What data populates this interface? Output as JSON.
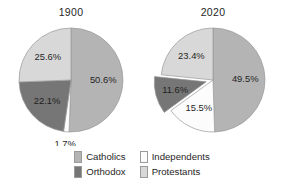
{
  "chart_data": [
    {
      "type": "pie",
      "title": "1900",
      "categories": [
        "Catholics",
        "Independents",
        "Orthodox",
        "Protestants"
      ],
      "values": [
        50.6,
        1.7,
        22.1,
        25.6
      ],
      "labels": [
        "50.6%",
        "1.7%",
        "22.1%",
        "25.6%"
      ],
      "colors": [
        "#b4b4b4",
        "#fcfcfc",
        "#767676",
        "#d8d8d8"
      ],
      "exploded": [
        false,
        false,
        false,
        false
      ],
      "start_angle_deg": 0,
      "direction": "clockwise",
      "legend_position": "bottom",
      "grid": false,
      "xlabel": "",
      "ylabel": ""
    },
    {
      "type": "pie",
      "title": "2020",
      "categories": [
        "Catholics",
        "Independents",
        "Orthodox",
        "Protestants"
      ],
      "values": [
        49.5,
        15.5,
        11.6,
        23.4
      ],
      "labels": [
        "49.5%",
        "15.5%",
        "11.6%",
        "23.4%"
      ],
      "colors": [
        "#b4b4b4",
        "#fcfcfc",
        "#767676",
        "#d8d8d8"
      ],
      "exploded": [
        false,
        false,
        true,
        false
      ],
      "start_angle_deg": 0,
      "direction": "clockwise",
      "legend_position": "bottom",
      "grid": false,
      "xlabel": "",
      "ylabel": ""
    }
  ],
  "legend": {
    "items": [
      {
        "label": "Catholics",
        "color": "#b4b4b4"
      },
      {
        "label": "Independents",
        "color": "#fcfcfc"
      },
      {
        "label": "Orthodox",
        "color": "#767676"
      },
      {
        "label": "Protestants",
        "color": "#d8d8d8"
      }
    ]
  },
  "colors": {
    "catholics": "#b4b4b4",
    "independents": "#fcfcfc",
    "orthodox": "#767676",
    "protestants": "#d8d8d8",
    "outline": "#9a9a9a",
    "text": "#1f1f1f",
    "background": "#ffffff"
  }
}
